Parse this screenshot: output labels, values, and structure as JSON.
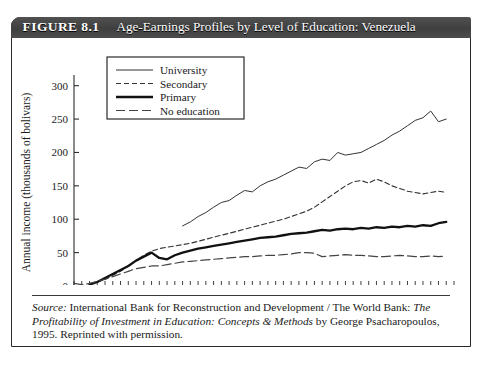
{
  "figure": {
    "number": "FIGURE 8.1",
    "title": "Age-Earnings Profiles by Level of Education: Venezuela"
  },
  "source": {
    "label": "Source:",
    "text_part1": " International Bank for Reconstruction and Development / The World Bank: ",
    "italic_title": "The Profitability of Investment in Education: Concepts & Methods",
    "text_part2": " by George Psacharopoulos, 1995. Reprinted with permission."
  },
  "chart_data": {
    "type": "line",
    "title": "Age-Earnings Profiles by Level of Education: Venezuela",
    "xlabel": "Age",
    "ylabel": "Annual income (thousands of bolivars)",
    "xlim": [
      10,
      59
    ],
    "ylim": [
      0,
      310
    ],
    "xticks": [
      10,
      25,
      40,
      55
    ],
    "xtick_labels": [
      "10",
      "25",
      "40",
      "55"
    ],
    "yticks": [
      0,
      50,
      100,
      150,
      200,
      250,
      300
    ],
    "ytick_labels": [
      "0",
      "50",
      "100",
      "150",
      "200",
      "250",
      "300"
    ],
    "minor_xtick_step": 1,
    "grid": false,
    "legend_position": "upper-left-inside",
    "series": [
      {
        "name": "University",
        "style": "thin-solid",
        "color": "#333333",
        "x": [
          24,
          25,
          26,
          27,
          28,
          29,
          30,
          31,
          32,
          33,
          34,
          35,
          36,
          37,
          38,
          39,
          40,
          41,
          42,
          43,
          44,
          45,
          46,
          47,
          48,
          49,
          50,
          51,
          52,
          53,
          54,
          55,
          56,
          57,
          58
        ],
        "values": [
          90,
          96,
          104,
          110,
          118,
          125,
          128,
          136,
          143,
          141,
          150,
          156,
          160,
          166,
          172,
          178,
          176,
          186,
          190,
          188,
          200,
          196,
          198,
          200,
          206,
          212,
          218,
          226,
          232,
          240,
          248,
          252,
          262,
          246,
          250
        ]
      },
      {
        "name": "Secondary",
        "style": "short-dash",
        "color": "#333333",
        "x": [
          12,
          13,
          14,
          15,
          16,
          17,
          18,
          19,
          20,
          21,
          22,
          23,
          24,
          25,
          26,
          27,
          28,
          29,
          30,
          31,
          32,
          33,
          34,
          35,
          36,
          37,
          38,
          39,
          40,
          41,
          42,
          43,
          44,
          45,
          46,
          47,
          48,
          49,
          50,
          51,
          52,
          53,
          54,
          55,
          56,
          57,
          58
        ],
        "values": [
          3,
          6,
          10,
          16,
          22,
          30,
          38,
          46,
          52,
          56,
          58,
          60,
          62,
          64,
          67,
          70,
          73,
          76,
          79,
          82,
          85,
          88,
          91,
          94,
          97,
          100,
          104,
          108,
          112,
          118,
          126,
          134,
          142,
          150,
          156,
          158,
          154,
          160,
          156,
          150,
          146,
          142,
          140,
          138,
          140,
          142,
          140
        ]
      },
      {
        "name": "Primary",
        "style": "thick-solid",
        "color": "#111111",
        "x": [
          12,
          13,
          14,
          15,
          16,
          17,
          18,
          19,
          20,
          21,
          22,
          23,
          24,
          25,
          26,
          27,
          28,
          29,
          30,
          31,
          32,
          33,
          34,
          35,
          36,
          37,
          38,
          39,
          40,
          41,
          42,
          43,
          44,
          45,
          46,
          47,
          48,
          49,
          50,
          51,
          52,
          53,
          54,
          55,
          56,
          57,
          58
        ],
        "values": [
          2,
          6,
          12,
          18,
          24,
          30,
          38,
          44,
          50,
          42,
          40,
          46,
          50,
          53,
          56,
          58,
          60,
          62,
          64,
          66,
          68,
          70,
          72,
          73,
          74,
          76,
          78,
          79,
          80,
          82,
          84,
          83,
          85,
          86,
          85,
          87,
          86,
          88,
          87,
          89,
          88,
          90,
          89,
          91,
          90,
          94,
          96
        ]
      },
      {
        "name": "No education",
        "style": "long-dash",
        "color": "#444444",
        "x": [
          10,
          11,
          12,
          13,
          14,
          15,
          16,
          17,
          18,
          19,
          20,
          21,
          22,
          23,
          24,
          25,
          26,
          27,
          28,
          29,
          30,
          31,
          32,
          33,
          34,
          35,
          36,
          37,
          38,
          39,
          40,
          41,
          42,
          43,
          44,
          45,
          46,
          47,
          48,
          49,
          50,
          51,
          52,
          53,
          54,
          55,
          56,
          57,
          58
        ],
        "values": [
          4,
          2,
          4,
          7,
          10,
          14,
          18,
          22,
          26,
          28,
          30,
          30,
          32,
          34,
          36,
          37,
          38,
          39,
          40,
          41,
          42,
          43,
          44,
          44,
          45,
          46,
          46,
          47,
          48,
          50,
          50,
          49,
          44,
          45,
          46,
          47,
          46,
          46,
          45,
          44,
          44,
          45,
          46,
          45,
          44,
          44,
          45,
          44,
          45
        ]
      }
    ],
    "legend": [
      {
        "label": "University",
        "style": "thin-solid"
      },
      {
        "label": "Secondary",
        "style": "short-dash"
      },
      {
        "label": "Primary",
        "style": "thick-solid"
      },
      {
        "label": "No education",
        "style": "long-dash"
      }
    ]
  }
}
